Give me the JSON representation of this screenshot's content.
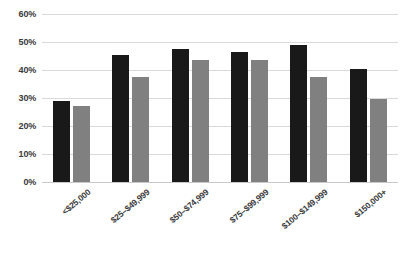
{
  "chart_data": {
    "type": "bar",
    "title": "",
    "xlabel": "",
    "ylabel": "",
    "ylim": [
      0,
      60
    ],
    "ytick_step": 10,
    "ytick_labels": [
      "0%",
      "10%",
      "20%",
      "30%",
      "40%",
      "50%",
      "60%"
    ],
    "grid": true,
    "legend": "none",
    "categories": [
      "<$25,000",
      "$25–$49,999",
      "$50–$74,999",
      "$75–$99,999",
      "$100–$149,999",
      "$150,000+"
    ],
    "series": [
      {
        "name": "series-1",
        "color": "#191919",
        "values": [
          29,
          45.5,
          47.5,
          46.5,
          49,
          40.5
        ]
      },
      {
        "name": "series-2",
        "color": "#808080",
        "values": [
          27,
          37.5,
          43.5,
          43.5,
          37.5,
          29.5
        ]
      }
    ]
  },
  "style": {
    "gridline_color": "#d9d9d9",
    "axis_text_color": "#3a3a3a",
    "background": "#ffffff"
  }
}
